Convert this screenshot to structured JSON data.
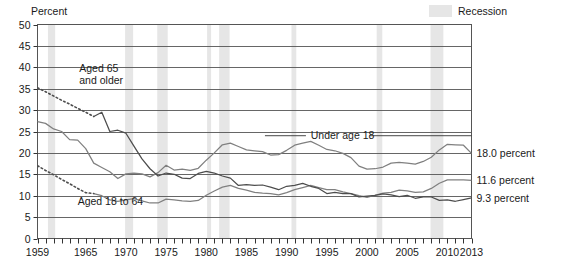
{
  "chart_data": {
    "type": "line",
    "title": "",
    "xlabel": "",
    "ylabel": "Percent",
    "ylim": [
      0,
      50
    ],
    "xlim": [
      1959,
      2013
    ],
    "ytick_labels": [
      "0",
      "5",
      "10",
      "15",
      "20",
      "25",
      "30",
      "35",
      "40",
      "45",
      "50"
    ],
    "ytick_values": [
      0,
      5,
      10,
      15,
      20,
      25,
      30,
      35,
      40,
      45,
      50
    ],
    "xtick_labels": [
      "1959",
      "1965",
      "1970",
      "1975",
      "1980",
      "1985",
      "1990",
      "1995",
      "2000",
      "2005",
      "2010",
      "2013"
    ],
    "xtick_values": [
      1959,
      1965,
      1970,
      1975,
      1980,
      1985,
      1990,
      1995,
      2000,
      2005,
      2010,
      2013
    ],
    "grid": true,
    "legend_position": "top-right",
    "legend": [
      {
        "label": "Recession",
        "swatch_color": "#e6e6e6",
        "kind": "band"
      }
    ],
    "annotations": [
      {
        "text": "Aged 65 and older",
        "lines": [
          "Aged 65",
          "and older"
        ],
        "x": 1964.2,
        "y": 39.0
      },
      {
        "text": "Under age 18",
        "lines": [
          "Under age 18"
        ],
        "x": 1993.0,
        "y": 23.2
      },
      {
        "text": "Aged 18 to 64",
        "lines": [
          "Aged 18 to 64"
        ],
        "x": 1964.0,
        "y": 7.8
      }
    ],
    "end_labels": [
      {
        "text": "18.0 percent",
        "series": "Under age 18",
        "value": 18.0
      },
      {
        "text": "11.6 percent",
        "series": "Aged 18 to 64",
        "value": 11.6
      },
      {
        "text": "9.3 percent",
        "series": "Aged 65 and older",
        "value": 9.3
      }
    ],
    "recession_bands": [
      {
        "start": 1960.3,
        "end": 1961.2
      },
      {
        "start": 1969.9,
        "end": 1970.9
      },
      {
        "start": 1973.9,
        "end": 1975.2
      },
      {
        "start": 1980.1,
        "end": 1980.6
      },
      {
        "start": 1981.6,
        "end": 1982.9
      },
      {
        "start": 1990.6,
        "end": 1991.2
      },
      {
        "start": 2001.2,
        "end": 2001.9
      },
      {
        "start": 2007.9,
        "end": 2009.5
      }
    ],
    "series": [
      {
        "name": "Under age 18",
        "color": "#808080",
        "style": "solid",
        "x": [
          1959,
          1960,
          1961,
          1962,
          1963,
          1964,
          1965,
          1966,
          1967,
          1968,
          1969,
          1970,
          1971,
          1972,
          1973,
          1974,
          1975,
          1976,
          1977,
          1978,
          1979,
          1980,
          1981,
          1982,
          1983,
          1984,
          1985,
          1986,
          1987,
          1988,
          1989,
          1990,
          1991,
          1992,
          1993,
          1994,
          1995,
          1996,
          1997,
          1998,
          1999,
          2000,
          2001,
          2002,
          2003,
          2004,
          2005,
          2006,
          2007,
          2008,
          2009,
          2010,
          2011,
          2012,
          2013
        ],
        "values": [
          27.3,
          26.9,
          25.6,
          25.0,
          23.1,
          23.0,
          21.0,
          17.6,
          16.6,
          15.6,
          14.0,
          15.1,
          15.3,
          15.1,
          14.4,
          15.4,
          17.1,
          16.0,
          16.2,
          15.9,
          16.4,
          18.3,
          20.0,
          21.9,
          22.3,
          21.5,
          20.7,
          20.5,
          20.3,
          19.5,
          19.6,
          20.6,
          21.8,
          22.3,
          22.7,
          21.8,
          20.8,
          20.5,
          19.9,
          18.9,
          16.9,
          16.2,
          16.3,
          16.7,
          17.6,
          17.8,
          17.6,
          17.4,
          18.0,
          19.0,
          20.7,
          22.0,
          21.9,
          21.8,
          19.9
        ]
      },
      {
        "name": "Aged 18 to 64",
        "color": "#808080",
        "style": "solid",
        "x": [
          1966,
          1967,
          1968,
          1969,
          1970,
          1971,
          1972,
          1973,
          1974,
          1975,
          1976,
          1977,
          1978,
          1979,
          1980,
          1981,
          1982,
          1983,
          1984,
          1985,
          1986,
          1987,
          1988,
          1989,
          1990,
          1991,
          1992,
          1993,
          1994,
          1995,
          1996,
          1997,
          1998,
          1999,
          2000,
          2001,
          2002,
          2003,
          2004,
          2005,
          2006,
          2007,
          2008,
          2009,
          2010,
          2011,
          2012,
          2013
        ],
        "values": [
          10.5,
          10.0,
          9.0,
          8.7,
          9.0,
          9.3,
          8.8,
          8.3,
          8.3,
          9.2,
          9.0,
          8.8,
          8.7,
          8.9,
          10.1,
          11.1,
          12.0,
          12.4,
          11.7,
          11.3,
          10.8,
          10.6,
          10.5,
          10.2,
          10.7,
          11.4,
          11.9,
          12.4,
          11.9,
          11.4,
          11.4,
          10.9,
          10.5,
          10.0,
          9.6,
          10.1,
          10.6,
          10.8,
          11.3,
          11.1,
          10.8,
          10.9,
          11.7,
          12.9,
          13.7,
          13.7,
          13.7,
          13.6
        ]
      },
      {
        "name": "Aged 65 and older",
        "color": "#4d4d4d",
        "style": "solid",
        "x": [
          1966,
          1967,
          1968,
          1969,
          1970,
          1971,
          1972,
          1973,
          1974,
          1975,
          1976,
          1977,
          1978,
          1979,
          1980,
          1981,
          1982,
          1983,
          1984,
          1985,
          1986,
          1987,
          1988,
          1989,
          1990,
          1991,
          1992,
          1993,
          1994,
          1995,
          1996,
          1997,
          1998,
          1999,
          2000,
          2001,
          2002,
          2003,
          2004,
          2005,
          2006,
          2007,
          2008,
          2009,
          2010,
          2011,
          2012,
          2013
        ],
        "values": [
          28.5,
          29.5,
          25.0,
          25.3,
          24.6,
          21.6,
          18.6,
          16.3,
          14.6,
          15.3,
          15.0,
          14.1,
          14.0,
          15.2,
          15.7,
          15.3,
          14.6,
          14.1,
          12.4,
          12.6,
          12.4,
          12.5,
          12.0,
          11.4,
          12.2,
          12.4,
          12.9,
          12.2,
          11.7,
          10.5,
          10.8,
          10.5,
          10.5,
          9.7,
          9.9,
          10.1,
          10.4,
          10.2,
          9.8,
          10.1,
          9.4,
          9.7,
          9.7,
          8.9,
          9.0,
          8.7,
          9.1,
          9.5
        ]
      },
      {
        "name": "Aged 65 and older (projected)",
        "color": "#4d4d4d",
        "style": "dotted",
        "x": [
          1959,
          1960,
          1961,
          1962,
          1963,
          1964,
          1965,
          1966
        ],
        "values": [
          35.2,
          34.3,
          33.3,
          32.3,
          31.4,
          30.4,
          29.5,
          28.5
        ]
      },
      {
        "name": "Aged 18 to 64 (projected)",
        "color": "#4d4d4d",
        "style": "dotted",
        "x": [
          1959,
          1960,
          1961,
          1962,
          1963,
          1964,
          1965,
          1966
        ],
        "values": [
          17.0,
          15.9,
          14.9,
          13.8,
          12.8,
          11.7,
          10.7,
          10.5
        ]
      }
    ]
  }
}
